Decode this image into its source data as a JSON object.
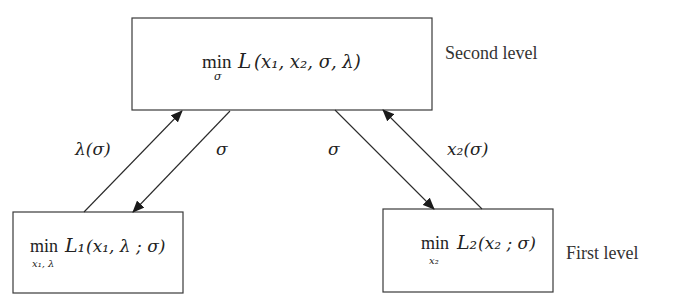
{
  "diagram": {
    "type": "bilevel-optimization",
    "levels": {
      "second": "Second level",
      "first": "First level"
    },
    "nodes": {
      "top": {
        "op": "min",
        "sub": "σ",
        "func": "L",
        "args": "(x₁, x₂, σ, λ)"
      },
      "bottom_left": {
        "op": "min",
        "sub": "x₁, λ",
        "func": "L₁",
        "args": "(x₁, λ ; σ)"
      },
      "bottom_right": {
        "op": "min",
        "sub": "x₂",
        "func": "L₂",
        "args": "(x₂ ; σ)"
      }
    },
    "edges": [
      {
        "from": "bottom_left",
        "to": "top",
        "label": "λ(σ)"
      },
      {
        "from": "top",
        "to": "bottom_left",
        "label": "σ"
      },
      {
        "from": "top",
        "to": "bottom_right",
        "label": "σ"
      },
      {
        "from": "bottom_right",
        "to": "top",
        "label": "x₂(σ)"
      }
    ]
  }
}
